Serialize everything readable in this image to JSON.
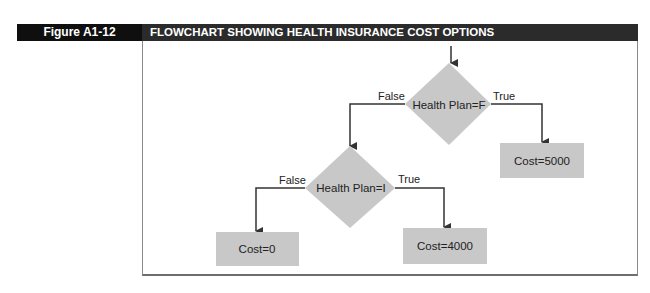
{
  "figure": {
    "label": "Figure A1-12",
    "title": "FLOWCHART SHOWING HEALTH INSURANCE COST OPTIONS"
  },
  "colors": {
    "label_bg": "#0f0f0f",
    "title_bg": "#2b2b2b",
    "shape_fill": "#c8c8c8",
    "line": "#333333"
  },
  "flowchart": {
    "decisions": [
      {
        "id": "d1",
        "label": "Health Plan=F"
      },
      {
        "id": "d2",
        "label": "Health Plan=I"
      }
    ],
    "outcomes": [
      {
        "id": "o1",
        "label": "Cost=5000"
      },
      {
        "id": "o2",
        "label": "Cost=0"
      },
      {
        "id": "o3",
        "label": "Cost=4000"
      }
    ],
    "edges": [
      {
        "from": "d1",
        "to": "d2",
        "label": "False"
      },
      {
        "from": "d1",
        "to": "o1",
        "label": "True"
      },
      {
        "from": "d2",
        "to": "o2",
        "label": "False"
      },
      {
        "from": "d2",
        "to": "o3",
        "label": "True"
      }
    ]
  }
}
